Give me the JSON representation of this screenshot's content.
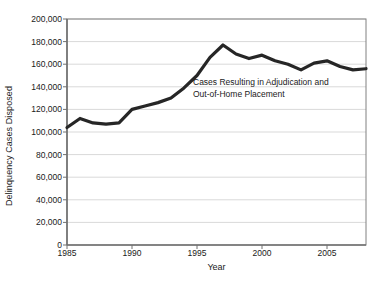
{
  "chart_data": {
    "type": "line",
    "title": "",
    "subtitle": "",
    "xlabel": "Year",
    "ylabel": "Delinquency Cases Disposed",
    "xlim": [
      1985,
      2008
    ],
    "ylim": [
      0,
      200000
    ],
    "ytick_labels": [
      "0",
      "20,000",
      "40,000",
      "60,000",
      "80,000",
      "100,000",
      "120,000",
      "140,000",
      "160,000",
      "180,000",
      "200,000"
    ],
    "ytick_values": [
      0,
      20000,
      40000,
      60000,
      80000,
      100000,
      120000,
      140000,
      160000,
      180000,
      200000
    ],
    "xtick_labels": [
      "1985",
      "1990",
      "1995",
      "2000",
      "2005"
    ],
    "xtick_values": [
      1985,
      1990,
      1995,
      2000,
      2005
    ],
    "grid": "horizontal",
    "legend": "none",
    "line_color": "#262626",
    "line_width": 3.2,
    "grid_color": "#d9d9d9",
    "axis_color": "#808080",
    "annotations": [
      {
        "text": "Cases Resulting in Adjudication and\nOut-of-Home Placement",
        "x": 1994.6,
        "y": 123000
      }
    ],
    "x": [
      1985,
      1986,
      1987,
      1988,
      1989,
      1990,
      1991,
      1992,
      1993,
      1994,
      1995,
      1996,
      1997,
      1998,
      1999,
      2000,
      2001,
      2002,
      2003,
      2004,
      2005,
      2006,
      2007,
      2008
    ],
    "values": [
      104000,
      112000,
      108000,
      107000,
      108000,
      120000,
      123000,
      126000,
      130000,
      139000,
      150000,
      166000,
      177000,
      169000,
      165000,
      168000,
      163000,
      160000,
      155000,
      161000,
      163000,
      158000,
      155000,
      156000
    ],
    "series": [
      {
        "name": "Cases Resulting in Adjudication and Out-of-Home Placement",
        "values": [
          104000,
          112000,
          108000,
          107000,
          108000,
          120000,
          123000,
          126000,
          130000,
          139000,
          150000,
          166000,
          177000,
          169000,
          165000,
          168000,
          163000,
          160000,
          155000,
          161000,
          163000,
          158000,
          155000,
          156000
        ]
      }
    ]
  }
}
